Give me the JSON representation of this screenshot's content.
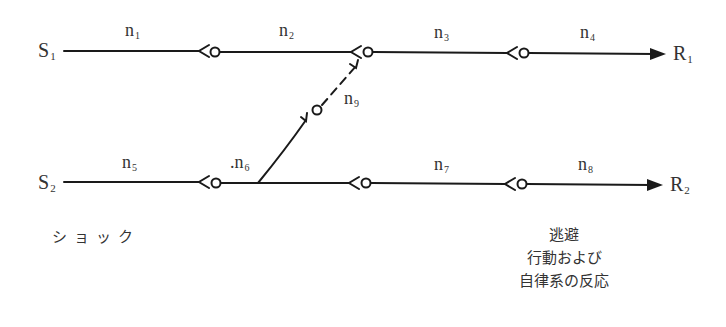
{
  "diagram": {
    "type": "neural-circuit",
    "inputs": [
      {
        "id": "S1",
        "base": "S",
        "sub": "1"
      },
      {
        "id": "S2",
        "base": "S",
        "sub": "2"
      }
    ],
    "outputs": [
      {
        "id": "R1",
        "base": "R",
        "sub": "1"
      },
      {
        "id": "R2",
        "base": "R",
        "sub": "2"
      }
    ],
    "neurons": [
      {
        "id": "n1",
        "base": "n",
        "sub": "1"
      },
      {
        "id": "n2",
        "base": "n",
        "sub": "2"
      },
      {
        "id": "n3",
        "base": "n",
        "sub": "3"
      },
      {
        "id": "n4",
        "base": "n",
        "sub": "4"
      },
      {
        "id": "n5",
        "base": "n",
        "sub": "5"
      },
      {
        "id": "n6",
        "base": ".n",
        "sub": "6"
      },
      {
        "id": "n7",
        "base": "n",
        "sub": "7"
      },
      {
        "id": "n8",
        "base": "n",
        "sub": "8"
      },
      {
        "id": "n9",
        "base": "n",
        "sub": "9"
      }
    ],
    "pathways": [
      {
        "from": "S1",
        "chain": [
          "n1",
          "n2",
          "n3",
          "n4"
        ],
        "to": "R1"
      },
      {
        "from": "S2",
        "chain": [
          "n5",
          "n6",
          "n7",
          "n8"
        ],
        "to": "R2"
      },
      {
        "branch": "n6",
        "via": "n9",
        "to_junction": "n2-n3",
        "style": "dashed"
      }
    ],
    "captions": {
      "stimulus": "ショック",
      "response_line1": "逃避",
      "response_line2": "行動および",
      "response_line3": "自律系の反応"
    },
    "colors": {
      "line": "#1a1a1a",
      "text": "#333333",
      "background": "#ffffff"
    }
  }
}
